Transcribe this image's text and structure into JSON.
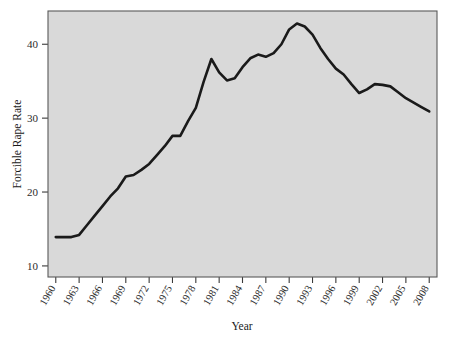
{
  "chart_data": {
    "type": "line",
    "title": "",
    "subtitle": "",
    "xlabel": "Year",
    "ylabel": "Forcible Rape Rate",
    "xlim": [
      1959,
      2009
    ],
    "ylim": [
      8.5,
      44.5
    ],
    "grid": false,
    "legend": null,
    "x_tick_labels": [
      "1960",
      "1963",
      "1966",
      "1969",
      "1972",
      "1975",
      "1978",
      "1981",
      "1984",
      "1987",
      "1990",
      "1993",
      "1996",
      "1999",
      "2002",
      "2005",
      "2008"
    ],
    "x_tick_values": [
      1960,
      1963,
      1966,
      1969,
      1972,
      1975,
      1978,
      1981,
      1984,
      1987,
      1990,
      1993,
      1996,
      1999,
      2002,
      2005,
      2008
    ],
    "y_tick_labels": [
      "10",
      "20",
      "30",
      "40"
    ],
    "y_tick_values": [
      10,
      20,
      30,
      40
    ],
    "line_color": "#1a1a1a",
    "plot_background_color": "#d9d9d9",
    "figure_background_color": "#ffffff",
    "x": [
      1960,
      1961,
      1962,
      1963,
      1964,
      1965,
      1966,
      1967,
      1968,
      1969,
      1970,
      1971,
      1972,
      1973,
      1974,
      1975,
      1976,
      1977,
      1978,
      1979,
      1980,
      1981,
      1982,
      1983,
      1984,
      1985,
      1986,
      1987,
      1988,
      1989,
      1990,
      1991,
      1992,
      1993,
      1994,
      1995,
      1996,
      1997,
      1998,
      1999,
      2000,
      2001,
      2002,
      2003,
      2004,
      2005,
      2006,
      2007,
      2008
    ],
    "values": [
      13.9,
      13.9,
      13.9,
      14.2,
      15.5,
      16.8,
      18.1,
      19.4,
      20.5,
      22.1,
      22.3,
      23.0,
      23.8,
      25.0,
      26.2,
      27.6,
      27.6,
      29.6,
      31.4,
      34.9,
      38.0,
      36.2,
      35.1,
      35.4,
      36.9,
      38.1,
      38.6,
      38.3,
      38.8,
      40.0,
      42.0,
      42.8,
      42.4,
      41.3,
      39.5,
      38.0,
      36.7,
      35.9,
      34.6,
      33.4,
      33.9,
      34.6,
      34.5,
      34.3,
      33.5,
      32.7,
      32.1,
      31.5,
      30.9
    ]
  },
  "axis": {
    "y_title": "Forcible Rape Rate",
    "x_title": "Year"
  }
}
